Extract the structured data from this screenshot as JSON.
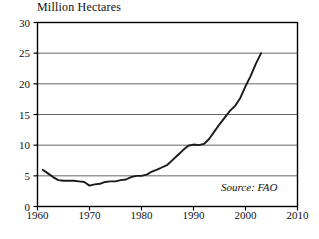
{
  "chart_data": {
    "type": "line",
    "title": "Million Hectares",
    "xlabel": "",
    "ylabel": "Million Hectares",
    "xlim": [
      1960,
      2010
    ],
    "ylim": [
      0,
      30
    ],
    "xticks": [
      1960,
      1970,
      1980,
      1990,
      2000,
      2010
    ],
    "xticklabels": [
      "1960",
      "1970",
      "1980",
      "1990",
      "2000",
      "2010"
    ],
    "yticks": [
      0,
      5,
      10,
      15,
      20,
      25,
      30
    ],
    "yticklabels": [
      "0",
      "5",
      "10",
      "15",
      "20",
      "25",
      "30"
    ],
    "grid": "horizontal",
    "legend": "none",
    "annotation": "Source: FAO",
    "series": [
      {
        "name": "Area",
        "x": [
          1961,
          1962,
          1963,
          1964,
          1965,
          1966,
          1967,
          1968,
          1969,
          1970,
          1971,
          1972,
          1973,
          1974,
          1975,
          1976,
          1977,
          1978,
          1979,
          1980,
          1981,
          1982,
          1983,
          1984,
          1985,
          1986,
          1987,
          1988,
          1989,
          1990,
          1991,
          1992,
          1993,
          1994,
          1995,
          1996,
          1997,
          1998,
          1999,
          2000,
          2001,
          2002,
          2003
        ],
        "values": [
          6.0,
          5.4,
          4.8,
          4.3,
          4.2,
          4.2,
          4.2,
          4.1,
          4.0,
          3.4,
          3.6,
          3.7,
          4.0,
          4.1,
          4.1,
          4.3,
          4.4,
          4.8,
          5.0,
          5.0,
          5.2,
          5.7,
          6.0,
          6.4,
          6.8,
          7.6,
          8.4,
          9.2,
          9.9,
          10.1,
          10.0,
          10.2,
          11.0,
          12.2,
          13.4,
          14.5,
          15.6,
          16.4,
          17.7,
          19.6,
          21.3,
          23.3,
          25.0
        ]
      }
    ]
  },
  "axes": {
    "title": "Million Hectares",
    "source_note": "Source: FAO"
  },
  "colors": {
    "line": "#1a1a1a",
    "grid": "#555555",
    "frame": "#000000",
    "background": "#ffffff"
  }
}
